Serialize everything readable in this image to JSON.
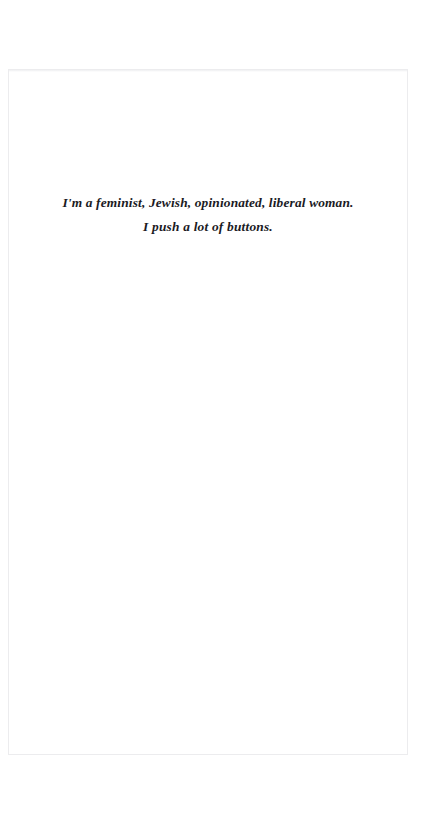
{
  "document": {
    "type": "scanned-book-page",
    "page_background_color": "#ffffff",
    "page_border_color": "#ececee",
    "ink_color": "#1b1b1f",
    "epigraph": {
      "alignment": "center",
      "style": "bold-italic-serif",
      "lines": [
        "I'm a feminist, Jewish, opinionated, liberal woman.",
        "I push a lot of buttons."
      ],
      "full_text": "I'm a feminist, Jewish, opinionated, liberal woman. I push a lot of buttons."
    }
  }
}
